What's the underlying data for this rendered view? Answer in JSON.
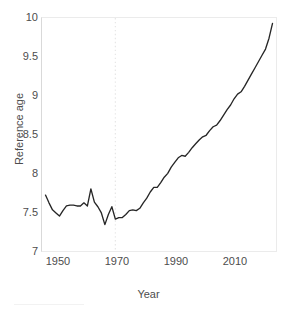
{
  "figure": {
    "background_color": "#ffffff",
    "panel_border_color": "#ebebeb",
    "line_color": "#262626",
    "text_color": "#4d4d4d",
    "marker_line_color": "#e6e6e6"
  },
  "axes": {
    "x_title": "Year",
    "y_title": "Reference age",
    "x_ticks": [
      "1950",
      "1970",
      "1990",
      "2010"
    ],
    "y_ticks": [
      "7",
      "7.5",
      "8",
      "8.5",
      "9",
      "9.5",
      "10"
    ]
  },
  "chart_data": {
    "type": "line",
    "title": "",
    "xlabel": "Year",
    "ylabel": "Reference age",
    "xlim": [
      1947,
      2014
    ],
    "ylim": [
      7,
      10
    ],
    "xticks": [
      1950,
      1970,
      1990,
      2010
    ],
    "yticks": [
      7,
      7.5,
      8,
      8.5,
      9,
      9.5,
      10
    ],
    "grid": false,
    "legend": "none",
    "annotations": [
      {
        "type": "vline",
        "x": 1968,
        "style": "dotted",
        "color": "#e6e6e6"
      }
    ],
    "series": [
      {
        "name": "Reference age",
        "x": [
          1948,
          1949,
          1950,
          1951,
          1952,
          1953,
          1954,
          1955,
          1956,
          1957,
          1958,
          1959,
          1960,
          1961,
          1962,
          1963,
          1964,
          1965,
          1966,
          1967,
          1968,
          1969,
          1970,
          1971,
          1972,
          1973,
          1974,
          1975,
          1976,
          1977,
          1978,
          1979,
          1980,
          1981,
          1982,
          1983,
          1984,
          1985,
          1986,
          1987,
          1988,
          1989,
          1990,
          1991,
          1992,
          1993,
          1994,
          1995,
          1996,
          1997,
          1998,
          1999,
          2000,
          2001,
          2002,
          2003,
          2004,
          2005,
          2006,
          2007,
          2008,
          2009,
          2010,
          2011,
          2012,
          2013
        ],
        "y": [
          7.72,
          7.62,
          7.53,
          7.49,
          7.45,
          7.52,
          7.58,
          7.59,
          7.59,
          7.58,
          7.58,
          7.62,
          7.58,
          7.8,
          7.63,
          7.57,
          7.49,
          7.34,
          7.47,
          7.57,
          7.41,
          7.43,
          7.43,
          7.47,
          7.52,
          7.53,
          7.52,
          7.55,
          7.62,
          7.68,
          7.76,
          7.82,
          7.82,
          7.88,
          7.95,
          8.0,
          8.08,
          8.14,
          8.2,
          8.23,
          8.22,
          8.27,
          8.33,
          8.38,
          8.43,
          8.47,
          8.49,
          8.55,
          8.6,
          8.62,
          8.68,
          8.75,
          8.82,
          8.88,
          8.96,
          9.02,
          9.05,
          9.12,
          9.2,
          9.28,
          9.36,
          9.44,
          9.52,
          9.6,
          9.74,
          9.93
        ]
      }
    ]
  }
}
